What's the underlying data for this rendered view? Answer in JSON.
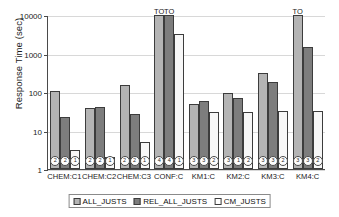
{
  "chart_data": {
    "type": "bar",
    "title": "",
    "xlabel": "",
    "ylabel": "Response Time (sec)",
    "yscale": "log",
    "ylim": [
      1,
      10000
    ],
    "yticks": [
      1,
      10,
      100,
      1000,
      10000
    ],
    "ytick_labels": [
      "1",
      "10",
      "100",
      "1000",
      "10000"
    ],
    "grid": true,
    "legend_position": "bottom",
    "categories": [
      "CHEM:C1",
      "CHEM:C2",
      "CHEM:C3",
      "CONF:C",
      "KM1:C",
      "KM2:C",
      "KM3:C",
      "KM4:C"
    ],
    "series": [
      {
        "name": "ALL_JUSTS",
        "color": "#b4b4b4",
        "values": [
          105,
          38,
          155,
          10000,
          50,
          95,
          320,
          10000
        ]
      },
      {
        "name": "REL_ALL_JUSTS",
        "color": "#7d7d7d",
        "values": [
          22,
          40,
          27,
          10000,
          57,
          72,
          180,
          1450
        ]
      },
      {
        "name": "CM_JUSTS",
        "color": "#ffffff",
        "values": [
          3.2,
          2.1,
          5.0,
          3200,
          30,
          30,
          32,
          32
        ]
      }
    ],
    "annotations": [
      {
        "category": "CONF:C",
        "series": "ALL_JUSTS",
        "text": "TO"
      },
      {
        "category": "CONF:C",
        "series": "REL_ALL_JUSTS",
        "text": "TO"
      },
      {
        "category": "KM4:C",
        "series": "ALL_JUSTS",
        "text": "TO"
      }
    ],
    "bar_badges": [
      {
        "category": "CHEM:C1",
        "labels": [
          "2",
          "2",
          "1"
        ]
      },
      {
        "category": "CHEM:C2",
        "labels": [
          "2",
          "2",
          "1"
        ]
      },
      {
        "category": "CHEM:C3",
        "labels": [
          "2",
          "2",
          "1"
        ]
      },
      {
        "category": "CONF:C",
        "labels": [
          "4",
          "4",
          "1"
        ]
      },
      {
        "category": "KM1:C",
        "labels": [
          "3",
          "3",
          "2"
        ]
      },
      {
        "category": "KM2:C",
        "labels": [
          "3",
          "1",
          "2"
        ]
      },
      {
        "category": "KM3:C",
        "labels": [
          "3",
          "3",
          "2"
        ]
      },
      {
        "category": "KM4:C",
        "labels": [
          "3",
          "3",
          "2"
        ]
      }
    ]
  },
  "legend": {
    "items": [
      {
        "label": "ALL_JUSTS"
      },
      {
        "label": "REL_ALL_JUSTS"
      },
      {
        "label": "CM_JUSTS"
      }
    ]
  }
}
